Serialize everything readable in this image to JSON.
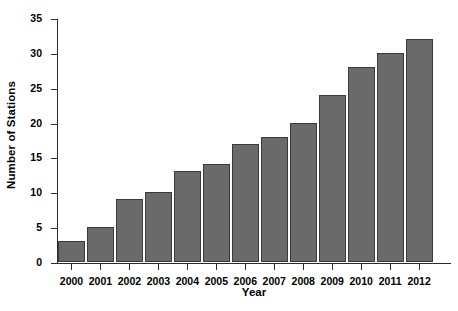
{
  "chart_data": {
    "type": "bar",
    "title": "",
    "xlabel": "Year",
    "ylabel": "Number of Stations",
    "categories": [
      "2000",
      "2001",
      "2002",
      "2003",
      "2004",
      "2005",
      "2006",
      "2007",
      "2008",
      "2009",
      "2010",
      "2011",
      "2012"
    ],
    "values": [
      3,
      5,
      9,
      10,
      13,
      14,
      17,
      18,
      20,
      24,
      28,
      30,
      32
    ],
    "series": [
      {
        "name": "Number of Stations",
        "values": [
          3,
          5,
          9,
          10,
          13,
          14,
          17,
          18,
          20,
          24,
          28,
          30,
          32
        ]
      }
    ],
    "ylim": [
      0,
      35
    ],
    "yticks": [
      0,
      5,
      10,
      15,
      20,
      25,
      30,
      35
    ],
    "ytick_labels": [
      "0",
      "5",
      "10",
      "15",
      "20",
      "25",
      "30",
      "35"
    ],
    "grid": false,
    "legend": null,
    "bar_color": "#6a6a6a",
    "bar_edge_color": "#3a3a3a",
    "background_color": "#ffffff",
    "axis_color": "#2b2b2b"
  }
}
